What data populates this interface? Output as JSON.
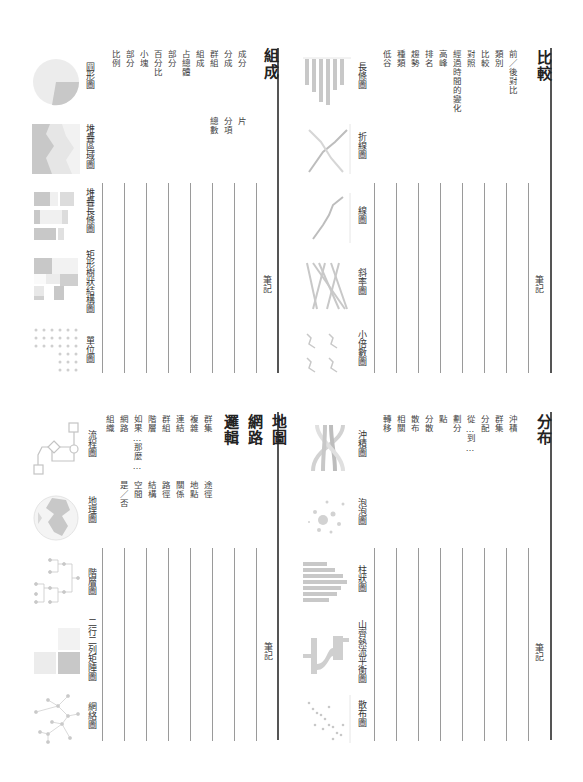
{
  "sections": {
    "comparison": {
      "title": "比較",
      "keywords": [
        "前／後對比",
        "類別",
        "比較",
        "對照",
        "經過時間的變化",
        "高峰",
        "排名",
        "趨勢",
        "種類",
        "低谷"
      ],
      "note_label": "筆記",
      "charts": [
        {
          "label": "長條圖",
          "icon": "bar-chart-icon"
        },
        {
          "label": "折線圖",
          "icon": "polyline-chart-icon"
        },
        {
          "label": "線圖",
          "icon": "line-chart-icon"
        },
        {
          "label": "斜率圖",
          "icon": "slope-chart-icon"
        },
        {
          "label": "小倍數圖",
          "icon": "small-multiples-icon"
        }
      ]
    },
    "distribution": {
      "title": "分布",
      "keywords": [
        "沖積",
        "群集",
        "分配",
        "從…到…",
        "劃分",
        "點",
        "分散",
        "散布",
        "相關",
        "轉移"
      ],
      "note_label": "筆記",
      "charts": [
        {
          "label": "沖積圖",
          "icon": "alluvial-chart-icon"
        },
        {
          "label": "泡泡圖",
          "icon": "bubble-chart-icon"
        },
        {
          "label": "柱狀圖",
          "icon": "histogram-icon"
        },
        {
          "label": "山齊熱流平衡圖",
          "icon": "sankey-chart-icon"
        },
        {
          "label": "散布圖",
          "icon": "scatter-plot-icon"
        }
      ]
    },
    "composition": {
      "title": "組成",
      "keywords_col1": [
        "成分",
        "分成",
        "群組",
        "組成",
        "占總體",
        "部分",
        "百分比",
        "小塊",
        "部分",
        "比例"
      ],
      "keywords_col2": [
        "片",
        "分項",
        "總數"
      ],
      "note_label": "筆記",
      "charts": [
        {
          "label": "圓形圖",
          "icon": "pie-chart-icon"
        },
        {
          "label": "堆疊區域圖",
          "icon": "stacked-area-icon"
        },
        {
          "label": "堆疊長條圖",
          "icon": "stacked-bar-icon"
        },
        {
          "label": "矩形樹狀結構圖",
          "icon": "treemap-icon"
        },
        {
          "label": "單位圖",
          "icon": "unit-chart-icon"
        }
      ]
    },
    "map_network_logic": {
      "titles": [
        "地圖",
        "網路",
        "邏輯"
      ],
      "keywords_col1": [
        "群集",
        "複雜",
        "連結",
        "群組",
        "階層",
        "如果…那麼…",
        "網路",
        "組織"
      ],
      "keywords_col2": [
        "途徑",
        "地點",
        "關係",
        "路徑",
        "結構",
        "空間",
        "是／否"
      ],
      "note_label": "筆記",
      "charts": [
        {
          "label": "流程圖",
          "icon": "flowchart-icon"
        },
        {
          "label": "地理圖",
          "icon": "geographic-map-icon"
        },
        {
          "label": "階層圖",
          "icon": "hierarchy-chart-icon"
        },
        {
          "label": "二行二列矩陣圖",
          "icon": "two-by-two-matrix-icon"
        },
        {
          "label": "網絡圖",
          "icon": "network-graph-icon"
        }
      ]
    }
  },
  "colors": {
    "thumb_fill": "#c8c8c8",
    "thumb_light": "#e4e4e4",
    "rule": "#9a9a9a",
    "heavy_rule": "#555555"
  }
}
